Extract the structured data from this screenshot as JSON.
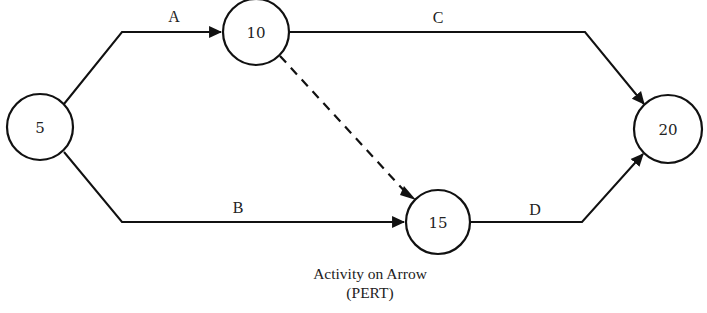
{
  "diagram": {
    "type": "activity-on-arrow network",
    "caption": {
      "line1": "Activity on Arrow",
      "line2": "(PERT)"
    },
    "nodes": [
      {
        "id": "5",
        "label": "5"
      },
      {
        "id": "10",
        "label": "10"
      },
      {
        "id": "15",
        "label": "15"
      },
      {
        "id": "20",
        "label": "20"
      }
    ],
    "edges": [
      {
        "label": "A",
        "from": "5",
        "to": "10",
        "style": "solid"
      },
      {
        "label": "B",
        "from": "5",
        "to": "15",
        "style": "solid"
      },
      {
        "label": "C",
        "from": "10",
        "to": "20",
        "style": "solid"
      },
      {
        "label": "D",
        "from": "15",
        "to": "20",
        "style": "solid"
      },
      {
        "label": "",
        "from": "10",
        "to": "15",
        "style": "dashed"
      }
    ],
    "colors": {
      "line": "#111111",
      "text": "#222222",
      "background": "#ffffff"
    }
  }
}
